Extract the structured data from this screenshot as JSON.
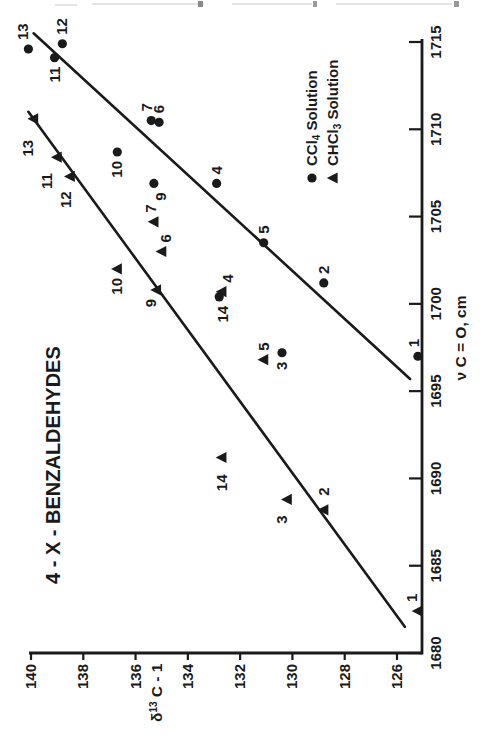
{
  "figure": {
    "ink_color": "#1a1a1a",
    "background_color": "#ffffff",
    "orientation": "figure printed landscape, scanned rotated 90 degrees counterclockwise",
    "page_edge_artifact": "illegible cut-off text line from page above"
  },
  "chart_data": {
    "type": "scatter",
    "title": "4 - X - BENZALDEHYDES",
    "xlabel": "ν C = O, cm",
    "xlabel_parts": {
      "pre": "ν C = O, cm"
    },
    "ylabel": "δ¹³ C - 1",
    "ylabel_parts": {
      "pre": "δ",
      "sup": "13",
      "post": " C - 1"
    },
    "xlim": [
      1680,
      1715
    ],
    "ylim": [
      126,
      140
    ],
    "x_ticks": [
      1680,
      1685,
      1690,
      1695,
      1700,
      1705,
      1710,
      1715
    ],
    "y_ticks": [
      126,
      128,
      130,
      132,
      134,
      136,
      138,
      140
    ],
    "grid": false,
    "legend_position": "right-middle",
    "series": [
      {
        "name": "CCl4 Solution",
        "legend_label": {
          "pre": "CCl",
          "sub": "4",
          "post": " Solution"
        },
        "marker": "circle",
        "points": [
          {
            "label": "1",
            "x": 1697.0,
            "y": 125.2,
            "side": "right",
            "dy": -4
          },
          {
            "label": "2",
            "x": 1701.2,
            "y": 128.8,
            "side": "right"
          },
          {
            "label": "3",
            "x": 1697.2,
            "y": 130.4,
            "side": "left"
          },
          {
            "label": "4",
            "x": 1706.9,
            "y": 132.9,
            "side": "right"
          },
          {
            "label": "5",
            "x": 1703.5,
            "y": 131.1,
            "side": "right"
          },
          {
            "label": "6",
            "x": 1710.4,
            "y": 135.1,
            "side": "right"
          },
          {
            "label": "7",
            "x": 1710.5,
            "y": 135.4,
            "side": "right",
            "dy": -4
          },
          {
            "label": "9",
            "x": 1706.9,
            "y": 135.3,
            "side": "left",
            "dy": 7
          },
          {
            "label": "10",
            "x": 1708.7,
            "y": 136.7,
            "side": "left"
          },
          {
            "label": "11",
            "x": 1714.1,
            "y": 139.1,
            "side": "left"
          },
          {
            "label": "12",
            "x": 1714.9,
            "y": 138.8,
            "side": "right"
          },
          {
            "label": "13",
            "x": 1714.6,
            "y": 140.1,
            "side": "right",
            "dy": -5
          },
          {
            "label": "14",
            "x": 1700.4,
            "y": 132.8,
            "side": "left",
            "dy": 4
          }
        ]
      },
      {
        "name": "CHCl3 Solution",
        "legend_label": {
          "pre": "CHCl",
          "sub": "3",
          "post": " Solution"
        },
        "marker": "triangle",
        "points": [
          {
            "label": "1",
            "x": 1682.4,
            "y": 125.2,
            "side": "right",
            "dy": -6
          },
          {
            "label": "2",
            "x": 1688.2,
            "y": 128.8,
            "side": "right",
            "dx": 5
          },
          {
            "label": "3",
            "x": 1688.8,
            "y": 130.2,
            "side": "left",
            "dy": -5,
            "dx": -7
          },
          {
            "label": "4",
            "x": 1700.7,
            "y": 132.7,
            "side": "right",
            "dy": 6
          },
          {
            "label": "5",
            "x": 1696.8,
            "y": 131.1,
            "side": "right"
          },
          {
            "label": "6",
            "x": 1703.0,
            "y": 135.0,
            "side": "right",
            "dy": 4
          },
          {
            "label": "7",
            "x": 1704.7,
            "y": 135.3,
            "side": "right",
            "dy": -3
          },
          {
            "label": "9",
            "x": 1700.8,
            "y": 135.2,
            "side": "left",
            "dy": -5
          },
          {
            "label": "10",
            "x": 1702.0,
            "y": 136.7,
            "side": "left"
          },
          {
            "label": "11",
            "x": 1708.4,
            "y": 139.0,
            "side": "left",
            "dy": -10,
            "dx": -7
          },
          {
            "label": "12",
            "x": 1707.3,
            "y": 138.5,
            "side": "left",
            "dy": -4,
            "dx": -6
          },
          {
            "label": "13",
            "x": 1710.6,
            "y": 139.9,
            "side": "left",
            "dy": -6,
            "dx": -12
          },
          {
            "label": "14",
            "x": 1691.2,
            "y": 132.7,
            "side": "left",
            "dx": -8
          }
        ]
      }
    ],
    "fit_lines": [
      {
        "series": "CCl4 Solution",
        "x1": 1695.7,
        "y1": 125.5,
        "x2": 1715.5,
        "y2": 139.9
      },
      {
        "series": "CHCl3 Solution",
        "x1": 1681.5,
        "y1": 125.7,
        "x2": 1711.0,
        "y2": 140.1
      }
    ]
  }
}
